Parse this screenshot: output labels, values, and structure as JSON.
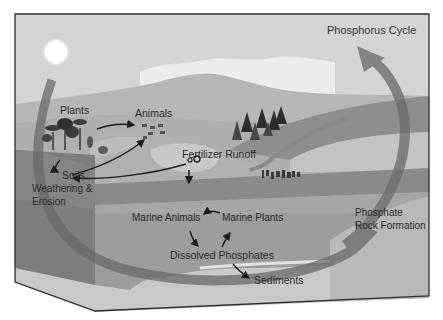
{
  "diagram": {
    "title": "Phosphorus Cycle",
    "labels": {
      "plants": "Plants",
      "animals": "Animals",
      "fertilizer_runoff": "Fertilizer Runoff",
      "soils": "Soils",
      "weathering_line1": "Weathering &",
      "weathering_line2": "Erosion",
      "marine_animals": "Marine Animals",
      "marine_plants": "Marine Plants",
      "dissolved_phosphates": "Dissolved Phosphates",
      "sediments": "Sediments",
      "phosphate_rock_line1": "Phosphate",
      "phosphate_rock_line2": "Rock Formation"
    },
    "icons": [
      "sun-icon",
      "cloud-icon",
      "tree-icon",
      "pine-tree-icon",
      "animal-herd-icon",
      "tractor-icon",
      "cycle-arrow-icon"
    ],
    "colors": {
      "sky": "#d4d4d4",
      "cloud": "#ececec",
      "mountain": "#b3b3b3",
      "land": "#a9a9a9",
      "soil_side": "#7c7c7c",
      "ocean_top": "#8d8d8d",
      "ocean_body": "#9a9a9a",
      "sediment": "#c9c9c9",
      "cycle_arrow": "#6f6f6f",
      "text": "#2a2a2a",
      "outline": "#3a3a3a"
    }
  }
}
